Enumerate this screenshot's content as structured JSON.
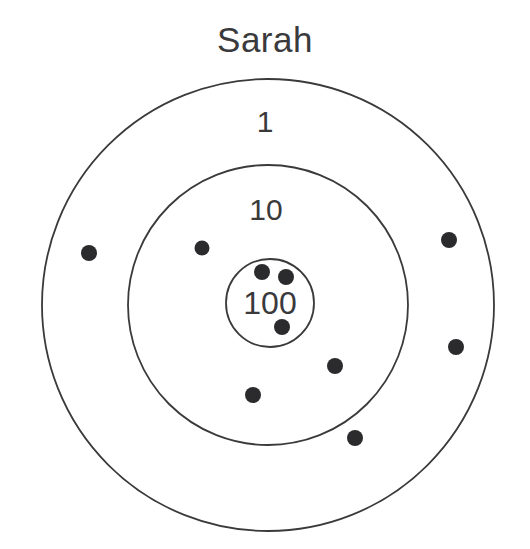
{
  "title": "Sarah",
  "colors": {
    "ring_stroke": "#3a3a3c",
    "label_text": "#3a3a3c",
    "dot_fill": "#2b2b2d",
    "background": "#ffffff"
  },
  "chart_data": {
    "type": "scatter",
    "title": "Sarah",
    "xlabel": "",
    "ylabel": "",
    "center": {
      "x": 268,
      "y": 305
    },
    "rings": [
      {
        "label": "1",
        "radius": 226,
        "label_x": 265,
        "label_y": 122,
        "score": 1
      },
      {
        "label": "10",
        "radius": 140,
        "label_x": 266,
        "label_y": 210,
        "score": 10
      },
      {
        "label": "100",
        "radius": 44,
        "label_x": 270,
        "label_y": 303,
        "score": 100
      }
    ],
    "points": [
      {
        "x": 89,
        "y": 253,
        "r": 8,
        "ring": "1"
      },
      {
        "x": 449,
        "y": 240,
        "r": 8,
        "ring": "1"
      },
      {
        "x": 456,
        "y": 347,
        "r": 8,
        "ring": "1"
      },
      {
        "x": 355,
        "y": 438,
        "r": 8,
        "ring": "1"
      },
      {
        "x": 202,
        "y": 248,
        "r": 7.5,
        "ring": "10"
      },
      {
        "x": 335,
        "y": 366,
        "r": 8,
        "ring": "10"
      },
      {
        "x": 253,
        "y": 395,
        "r": 8,
        "ring": "10"
      },
      {
        "x": 262,
        "y": 272,
        "r": 8,
        "ring": "100"
      },
      {
        "x": 286,
        "y": 277,
        "r": 8,
        "ring": "100"
      },
      {
        "x": 282,
        "y": 327,
        "r": 8,
        "ring": "100"
      }
    ],
    "grid": false,
    "legend": "none"
  }
}
